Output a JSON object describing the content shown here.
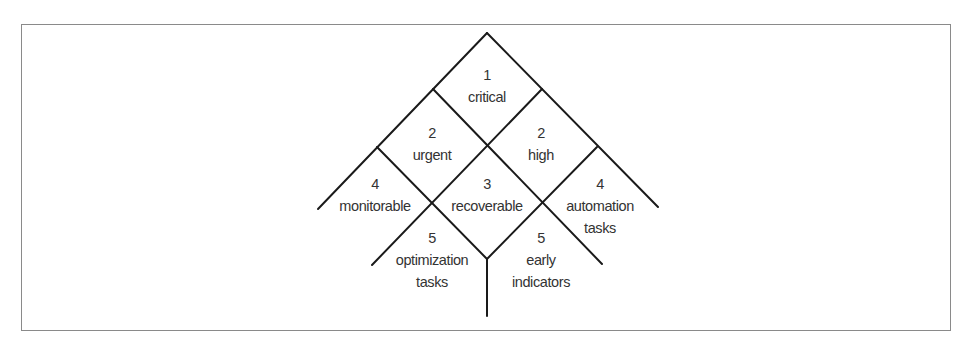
{
  "diagram": {
    "type": "priority-tree",
    "line_color": "#1a1a1a",
    "text_color": "#333333",
    "frame_color": "#8a8a8a",
    "cells": [
      {
        "id": "critical",
        "level": "1",
        "lines": [
          "critical"
        ]
      },
      {
        "id": "urgent",
        "level": "2",
        "lines": [
          "urgent"
        ]
      },
      {
        "id": "high",
        "level": "2",
        "lines": [
          "high"
        ]
      },
      {
        "id": "monitorable",
        "level": "4",
        "lines": [
          "monitorable"
        ]
      },
      {
        "id": "recoverable",
        "level": "3",
        "lines": [
          "recoverable"
        ]
      },
      {
        "id": "automation-tasks",
        "level": "4",
        "lines": [
          "automation",
          "tasks"
        ]
      },
      {
        "id": "optimization-tasks",
        "level": "5",
        "lines": [
          "optimization",
          "tasks"
        ]
      },
      {
        "id": "early-indicators",
        "level": "5",
        "lines": [
          "early",
          "indicators"
        ]
      }
    ]
  }
}
